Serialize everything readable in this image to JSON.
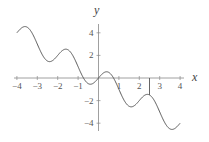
{
  "chart_data": {
    "type": "line",
    "title": "",
    "xlabel": "x",
    "ylabel": "y",
    "function": "y = -x + sin(pi x)",
    "xlim": [
      -4,
      4
    ],
    "ylim": [
      -4.5,
      4.5
    ],
    "grid": false,
    "legend": null,
    "x_ticks": [
      -4,
      -3,
      -2,
      -1,
      1,
      2,
      3,
      4
    ],
    "x_tick_labels": [
      "-4",
      "-3",
      "-2",
      "-1",
      "1",
      "2",
      "3",
      "4"
    ],
    "y_ticks": [
      4,
      2,
      -2,
      -4
    ],
    "y_tick_labels": [
      "4",
      "2",
      "-2",
      "-4"
    ],
    "series": [
      {
        "name": "curve",
        "color": "#555555",
        "x": [
          -4,
          -3.5,
          -3,
          -2.5,
          -2,
          -1.5,
          -1,
          -0.5,
          0,
          0.5,
          1,
          1.5,
          2,
          2.5,
          3,
          3.5,
          4
        ],
        "y": [
          4,
          4.5,
          3,
          1.5,
          2,
          2.5,
          1,
          -0.5,
          0,
          0.5,
          -1,
          -2.5,
          -2,
          -1.5,
          -3,
          -4.5,
          -4
        ]
      }
    ],
    "annotations": [
      {
        "type": "vertical-segment",
        "x": 2.5,
        "from_y": 0,
        "to_y": -1.5
      }
    ]
  },
  "labels": {
    "x_axis": "x",
    "y_axis": "y",
    "x_ticks": [
      "-4",
      "-3",
      "-2",
      "-1",
      "1",
      "2",
      "3",
      "4"
    ],
    "y_ticks": [
      "4",
      "2",
      "-2",
      "-4"
    ]
  }
}
